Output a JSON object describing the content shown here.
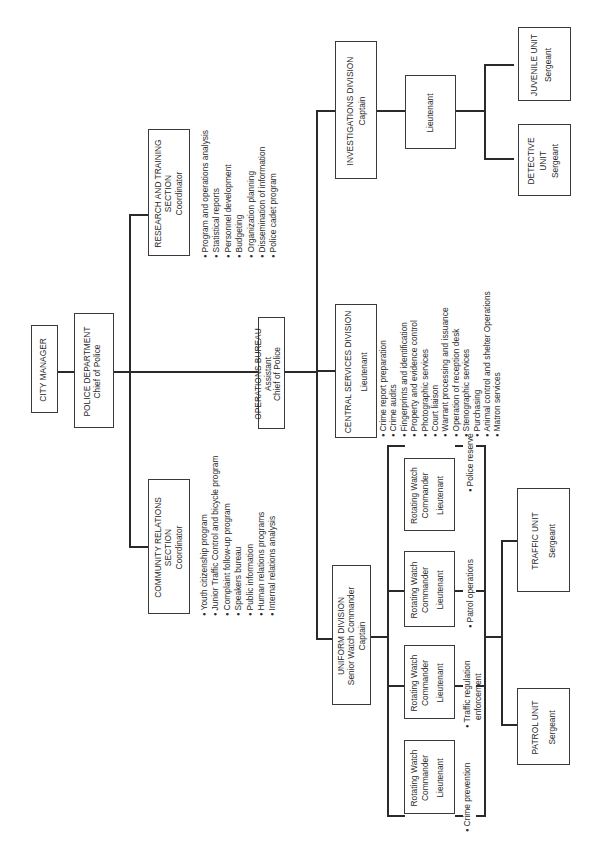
{
  "chart": {
    "orientation": "rotated-90-ccw",
    "nodes": {
      "city_manager": {
        "title": "CITY MANAGER"
      },
      "police_department": {
        "title": "POLICE DEPARTMENT",
        "subtitle": "Chief of Police"
      },
      "research_training": {
        "title_1": "RESEARCH AND TRAINING",
        "title_2": "SECTION",
        "subtitle": "Coordinator",
        "bullets": [
          "Program and operations analysis",
          "Statistical reports",
          "Personnel development",
          "Budgeting",
          "Organization planning",
          "Dissemination of information",
          "Police cadet program"
        ]
      },
      "community_relations": {
        "title_1": "COMMUNITY RELATIONS",
        "title_2": "SECTION",
        "subtitle": "Coordinator",
        "bullets": [
          "Youth citizenship program",
          "Junior Traffic Control and bicycle program",
          "Complaint follow-up program",
          "Speakers bureau",
          "Public information",
          "Human relations programs",
          "Internal relations analysis"
        ]
      },
      "operations_bureau": {
        "title": "OPERATIONS BUREAU",
        "subtitle_1": "Assistant",
        "subtitle_2": "Chief of Police"
      },
      "investigations_division": {
        "title": "INVESTIGATIONS DIVISION",
        "subtitle": "Captain"
      },
      "investigations_lieutenant": {
        "title": "Lieutenant"
      },
      "juvenile_unit": {
        "title": "JUVENILE UNIT",
        "subtitle": "Sergeant"
      },
      "detective_unit": {
        "title_1": "DETECTIVE",
        "title_2": "UNIT",
        "subtitle": "Sergeant"
      },
      "central_services": {
        "title": "CENTRAL SERVICES DIVISION",
        "subtitle": "Lieutenant",
        "bullets": [
          "Crime report preparation",
          "Crime audits",
          "Fingerprints and identification",
          "Property and evidence control",
          "Photographic services",
          "Court liaison",
          "Warrant processing and issuance",
          "Operation of reception desk",
          "Stenographic services",
          "Purchasing",
          "Animal control and shelter Operations",
          "Matron services"
        ]
      },
      "uniform_division": {
        "title": "UNIFORM DIVISION",
        "subtitle_1": "Senior Watch Commander",
        "subtitle_2": "Captain"
      },
      "watch_commanders": [
        {
          "line1": "Rotating Watch",
          "line2": "Commander",
          "rank": "Lieutenant",
          "duty_1": "Crime prevention",
          "duty_2": ""
        },
        {
          "line1": "Rotating Watch",
          "line2": "Commander",
          "rank": "Lieutenant",
          "duty_1": "Traffic regulation",
          "duty_2": "enforcement"
        },
        {
          "line1": "Rotating Watch",
          "line2": "Commander",
          "rank": "Lieutenant",
          "duty_1": "Patrol operations",
          "duty_2": ""
        },
        {
          "line1": "Rotating Watch",
          "line2": "Commander",
          "rank": "Lieutenant",
          "duty_1": "Police reserve",
          "duty_2": ""
        }
      ],
      "patrol_unit": {
        "title": "PATROL UNIT",
        "subtitle": "Sergeant"
      },
      "traffic_unit": {
        "title": "TRAFFIC UNIT",
        "subtitle": "Sergeant"
      }
    }
  }
}
